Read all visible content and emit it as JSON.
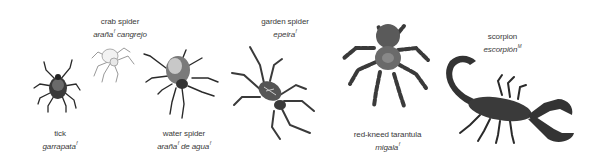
{
  "creatures": [
    {
      "id": "tick",
      "english": "tick",
      "spanish": "garrapata",
      "gender": "f"
    },
    {
      "id": "crab-spider",
      "english": "crab spider",
      "spanish_1": "araña",
      "gender_1": "f",
      "spanish_2": "cangrejo"
    },
    {
      "id": "water-spider",
      "english": "water spider",
      "spanish_1": "araña",
      "gender_1": "f",
      "spanish_2": "de agua",
      "gender_2": "f"
    },
    {
      "id": "garden-spider",
      "english": "garden spider",
      "spanish": "epeira",
      "gender": "f"
    },
    {
      "id": "red-kneed-tarantula",
      "english": "red-kneed tarantula",
      "spanish": "migala",
      "gender": "f"
    },
    {
      "id": "scorpion",
      "english": "scorpion",
      "spanish": "escorpión",
      "gender": "M"
    }
  ]
}
